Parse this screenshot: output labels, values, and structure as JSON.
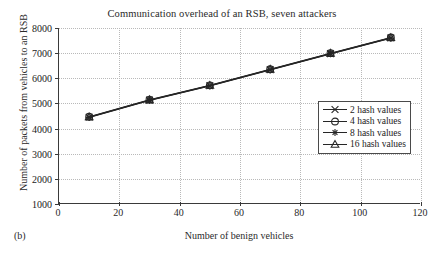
{
  "chart_data": {
    "type": "line",
    "title": "Communication overhead of an RSB, seven attackers",
    "xlabel": "Number of benign vehicles",
    "ylabel": "Number of packets from vehicles to an RSB",
    "panel_label": "(b)",
    "grid": true,
    "legend_position": "center-right",
    "xlim": [
      0,
      120
    ],
    "ylim": [
      1000,
      8000
    ],
    "xticks": [
      0,
      20,
      40,
      60,
      80,
      100,
      120
    ],
    "yticks": [
      1000,
      2000,
      3000,
      4000,
      5000,
      6000,
      7000,
      8000
    ],
    "x": [
      10,
      30,
      50,
      70,
      90,
      110
    ],
    "series": [
      {
        "name": "2 hash values",
        "marker": "cross",
        "values": [
          4450,
          5130,
          5700,
          6340,
          6980,
          7600
        ]
      },
      {
        "name": "4 hash values",
        "marker": "circle",
        "values": [
          4470,
          5150,
          5720,
          6360,
          7000,
          7620
        ]
      },
      {
        "name": "8 hash values",
        "marker": "asterisk",
        "values": [
          4440,
          5120,
          5690,
          6330,
          6970,
          7590
        ]
      },
      {
        "name": "16 hash values",
        "marker": "triangle",
        "values": [
          4460,
          5140,
          5710,
          6350,
          6990,
          7610
        ]
      }
    ],
    "line_color": "#262626"
  }
}
